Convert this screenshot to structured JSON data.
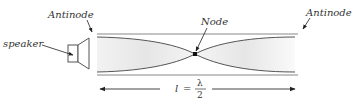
{
  "diagram": {
    "labels": {
      "antinode_left": "Antinode",
      "antinode_right": "Antinode",
      "node": "Node",
      "speaker": "speaker"
    },
    "dimension": {
      "variable": "l",
      "equals": "=",
      "numerator": "λ",
      "denominator": "2"
    },
    "colors": {
      "line": "#555555",
      "tube_wall": "#777777",
      "fill": "#e8e8e8",
      "text": "#333333",
      "background": "#ffffff"
    }
  }
}
